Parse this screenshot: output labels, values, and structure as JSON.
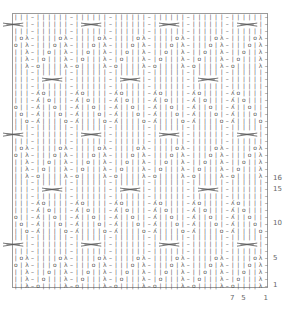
{
  "chart": {
    "columns": 46,
    "rows": 40,
    "repeat_rows": 16,
    "row_units": {
      "1": "O||||λ-",
      "2": "|O|||λ-",
      "3": "||O||λ-",
      "4": "|||O|λ-",
      "5": "||||Oλ-",
      "6": "||||||-",
      "7": "CABLE_A",
      "8": "||||||-",
      "9": "A||||O-",
      "10": "A|||O|-",
      "11": "A||O||-",
      "12": "A|O|||-",
      "13": "AO||||-",
      "14": "||||||-",
      "15": "CABLE_B",
      "16": "||||||-"
    },
    "symbols": {
      "|": "knit",
      "-": "purl",
      "O": "yarn-over",
      "λ": "left-decrease",
      "A": "right-decrease"
    },
    "line_color": "#9a9a9a",
    "symbol_color": "#555555"
  },
  "row_labels": [
    {
      "text": "1",
      "row": 1
    },
    {
      "text": "5",
      "row": 5
    },
    {
      "text": "10",
      "row": 10
    },
    {
      "text": "15",
      "row": 15
    },
    {
      "text": "16",
      "row": 16
    }
  ],
  "col_labels": [
    {
      "text": "1",
      "col": 1
    },
    {
      "text": "5",
      "col": 5
    },
    {
      "text": "7",
      "col": 7
    }
  ]
}
